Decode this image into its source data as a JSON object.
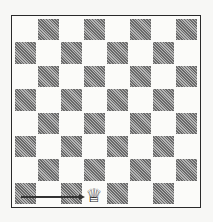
{
  "diagram": {
    "type": "chessboard",
    "size": 8,
    "light_color": "#fbfbf9",
    "dark_color": "#8a8a8a",
    "pieces": [
      {
        "piece": "white-queen",
        "glyph": "♕",
        "square": "d1"
      }
    ],
    "arrows": [
      {
        "from": "a1",
        "to": "d1",
        "direction": "right"
      }
    ]
  }
}
